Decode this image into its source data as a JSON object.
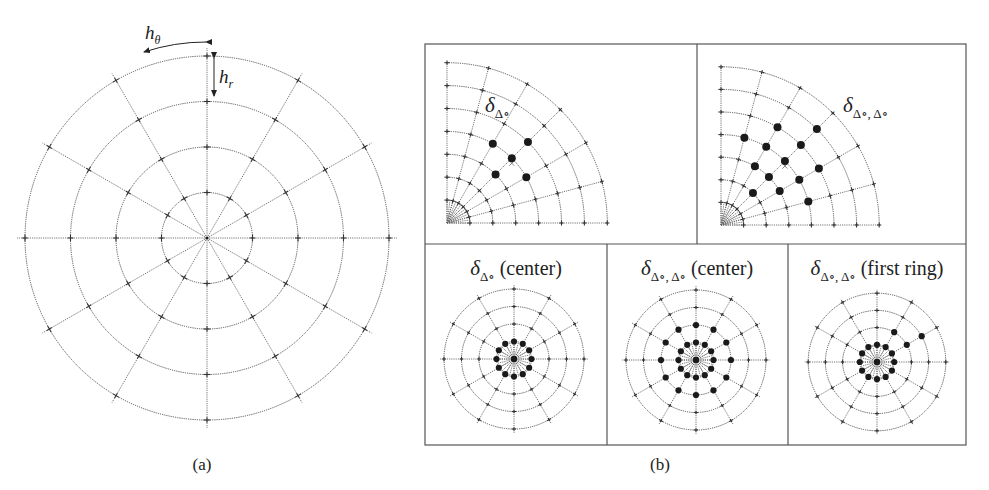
{
  "figure": {
    "panel_a": {
      "caption": "(a)",
      "h_theta_label": "h",
      "h_theta_sub": "θ",
      "h_r_label": "h",
      "h_r_sub": "r",
      "grid": {
        "cx": 207,
        "cy": 238,
        "rings": 4,
        "ring_spacing": 45.5,
        "spokes": 12
      }
    },
    "panel_b": {
      "caption": "(b)",
      "frame": {
        "x": 425,
        "y": 44,
        "w": 541,
        "h": 401,
        "top_split_x": 697,
        "mid_y": 244,
        "bottom_splits_x": [
          607,
          788
        ]
      },
      "subpanels": [
        {
          "id": "quadrant-single",
          "label_main": "δ",
          "label_sub": "Δ∘",
          "label_suffix": "",
          "type": "quadrant",
          "origin": [
            447,
            223
          ],
          "rings": 7,
          "ring_spacing": 22.9,
          "spoke_step_deg": 15,
          "label_pos": [
            485,
            112
          ],
          "dots": [
            [
              4,
              45
            ],
            [
              3,
              45
            ],
            [
              5,
              45
            ],
            [
              4,
              30
            ],
            [
              4,
              60
            ]
          ],
          "x_mark": [
            4,
            45
          ]
        },
        {
          "id": "quadrant-double",
          "label_main": "δ",
          "label_sub": "Δ∘, Δ∘",
          "label_suffix": "",
          "type": "quadrant",
          "origin": [
            721,
            225
          ],
          "rings": 7,
          "ring_spacing": 22.6,
          "spoke_step_deg": 15,
          "label_pos": [
            843,
            112
          ],
          "dots": [
            [
              4,
              15
            ],
            [
              4,
              30
            ],
            [
              4,
              45
            ],
            [
              4,
              60
            ],
            [
              4,
              75
            ],
            [
              3,
              30
            ],
            [
              3,
              45
            ],
            [
              3,
              60
            ],
            [
              5,
              30
            ],
            [
              5,
              45
            ],
            [
              5,
              60
            ],
            [
              2,
              45
            ],
            [
              6,
              45
            ]
          ],
          "x_mark": [
            4,
            45
          ]
        },
        {
          "id": "full-single-center",
          "label_main": "δ",
          "label_sub": "Δ∘",
          "label_suffix": " (center)",
          "type": "full",
          "origin": [
            514,
            359
          ],
          "rings": 4,
          "ring_spacing": 17.5,
          "spokes": 12,
          "label_pos": [
            516,
            275
          ],
          "center_dot": true,
          "dots": [
            [
              1,
              0
            ],
            [
              1,
              30
            ],
            [
              1,
              60
            ],
            [
              1,
              90
            ],
            [
              1,
              120
            ],
            [
              1,
              150
            ],
            [
              1,
              180
            ],
            [
              1,
              210
            ],
            [
              1,
              240
            ],
            [
              1,
              270
            ],
            [
              1,
              300
            ],
            [
              1,
              330
            ]
          ]
        },
        {
          "id": "full-double-center",
          "label_main": "δ",
          "label_sub": "Δ∘, Δ∘",
          "label_suffix": " (center)",
          "type": "full",
          "origin": [
            696,
            360
          ],
          "rings": 4,
          "ring_spacing": 17.5,
          "spokes": 12,
          "label_pos": [
            697,
            275
          ],
          "center_dot": true,
          "dots": [
            [
              1,
              0
            ],
            [
              1,
              30
            ],
            [
              1,
              60
            ],
            [
              1,
              90
            ],
            [
              1,
              120
            ],
            [
              1,
              150
            ],
            [
              1,
              180
            ],
            [
              1,
              210
            ],
            [
              1,
              240
            ],
            [
              1,
              270
            ],
            [
              1,
              300
            ],
            [
              1,
              330
            ],
            [
              2,
              0
            ],
            [
              2,
              30
            ],
            [
              2,
              60
            ],
            [
              2,
              90
            ],
            [
              2,
              120
            ],
            [
              2,
              150
            ],
            [
              2,
              180
            ],
            [
              2,
              210
            ],
            [
              2,
              240
            ],
            [
              2,
              270
            ],
            [
              2,
              300
            ],
            [
              2,
              330
            ]
          ]
        },
        {
          "id": "full-double-first-ring",
          "label_main": "δ",
          "label_sub": "Δ∘, Δ∘",
          "label_suffix": " (first ring)",
          "type": "full",
          "origin": [
            877,
            362
          ],
          "rings": 4,
          "ring_spacing": 17.2,
          "spokes": 12,
          "label_pos": [
            877,
            275
          ],
          "center_dot": true,
          "dots": [
            [
              1,
              0
            ],
            [
              1,
              30
            ],
            [
              1,
              60
            ],
            [
              1,
              90
            ],
            [
              1,
              120
            ],
            [
              1,
              150
            ],
            [
              1,
              180
            ],
            [
              1,
              210
            ],
            [
              1,
              240
            ],
            [
              1,
              270
            ],
            [
              1,
              300
            ],
            [
              1,
              330
            ],
            [
              2,
              30
            ],
            [
              2,
              60
            ],
            [
              3,
              30
            ]
          ]
        }
      ]
    }
  }
}
